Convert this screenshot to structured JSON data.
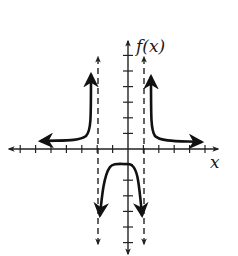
{
  "chart_data": {
    "type": "line",
    "title": "",
    "xlabel": "x",
    "ylabel": "f(x)",
    "xlim": [
      -7.8,
      5.9
    ],
    "ylim": [
      -6.9,
      7.0
    ],
    "x_ticks": [
      -7,
      -6,
      -5,
      -4,
      -3,
      -2,
      -1,
      1,
      2,
      3,
      4,
      5
    ],
    "y_ticks": [
      -6,
      -5,
      -4,
      -3,
      -2,
      -1,
      1,
      2,
      3,
      4,
      5,
      6
    ],
    "tick_labels_shown": false,
    "grid": false,
    "vertical_asymptotes": [
      -2,
      1
    ],
    "horizontal_asymptotes": [
      0
    ],
    "series": [
      {
        "name": "left branch (x < -2)",
        "points": [
          [
            -5.6,
            0.5
          ],
          [
            -4,
            0.6
          ],
          [
            -3,
            0.9
          ],
          [
            -2.5,
            1.8
          ],
          [
            -2.4,
            3
          ],
          [
            -2.4,
            5.0
          ]
        ],
        "ends": "arrows at both ends"
      },
      {
        "name": "middle branch (-2 < x < 1)",
        "points": [
          [
            -1.8,
            -4.4
          ],
          [
            -1.5,
            -2
          ],
          [
            -1,
            -1.0
          ],
          [
            -0.5,
            -1.0
          ],
          [
            0,
            -1.0
          ],
          [
            0.3,
            -1.2
          ],
          [
            0.6,
            -2.2
          ],
          [
            0.9,
            -4.4
          ]
        ],
        "ends": "arrows at both ends"
      },
      {
        "name": "right branch (x > 1)",
        "points": [
          [
            1.5,
            4.8
          ],
          [
            1.5,
            3
          ],
          [
            1.6,
            1.5
          ],
          [
            2,
            0.8
          ],
          [
            3,
            0.55
          ],
          [
            4.9,
            0.5
          ]
        ],
        "ends": "arrows at both ends"
      }
    ],
    "colors": {
      "curve": "#111111",
      "axes": "#222222",
      "asymptote": "#222222",
      "background": "#ffffff"
    }
  },
  "labels": {
    "y_axis": "f(x)",
    "x_axis": "x"
  }
}
